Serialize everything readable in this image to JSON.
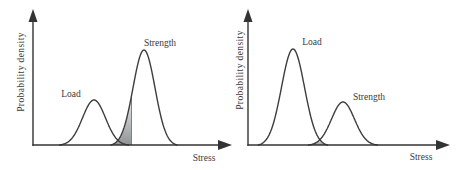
{
  "figure": {
    "colors": {
      "curve": "#3d3d3d",
      "axis": "#333333",
      "text": "#3a3a3a",
      "background": "#ffffff",
      "shade_top": "#f0f0f0",
      "shade_bottom": "#8f9494"
    },
    "panels": [
      {
        "ylabel": "Probability density",
        "xlabel": "Stress",
        "baseline": 145,
        "curves": [
          {
            "label": "Load",
            "mean": 94,
            "sd": 11.5,
            "height": 45
          },
          {
            "label": "Strength",
            "mean": 144,
            "sd": 11,
            "height": 95
          }
        ],
        "shade": {
          "type": "tail-cut",
          "curve": 1,
          "cut_x": 131.5
        }
      },
      {
        "ylabel": "Probability density",
        "xlabel": "Stress",
        "baseline": 145,
        "curves": [
          {
            "label": "Load",
            "mean": 293,
            "sd": 11.5,
            "height": 96
          },
          {
            "label": "Strength",
            "mean": 343,
            "sd": 11.5,
            "height": 43
          }
        ],
        "shade": {
          "type": "overlap",
          "curves": [
            0,
            1
          ]
        }
      }
    ]
  },
  "chart_data": [
    {
      "type": "area",
      "xlabel": "Stress",
      "ylabel": "Probability density",
      "series": [
        {
          "name": "Load",
          "shape": "bell",
          "position": "left",
          "relative_peak": "lower"
        },
        {
          "name": "Strength",
          "shape": "bell",
          "position": "right",
          "relative_peak": "higher"
        }
      ],
      "annotation": "gradient-shaded interference region at lower tail of Strength curve"
    },
    {
      "type": "area",
      "xlabel": "Stress",
      "ylabel": "Probability density",
      "series": [
        {
          "name": "Load",
          "shape": "bell",
          "position": "left",
          "relative_peak": "higher"
        },
        {
          "name": "Strength",
          "shape": "bell",
          "position": "right",
          "relative_peak": "lower"
        }
      ],
      "annotation": "small shaded overlap region where Load and Strength curves cross near baseline"
    }
  ]
}
